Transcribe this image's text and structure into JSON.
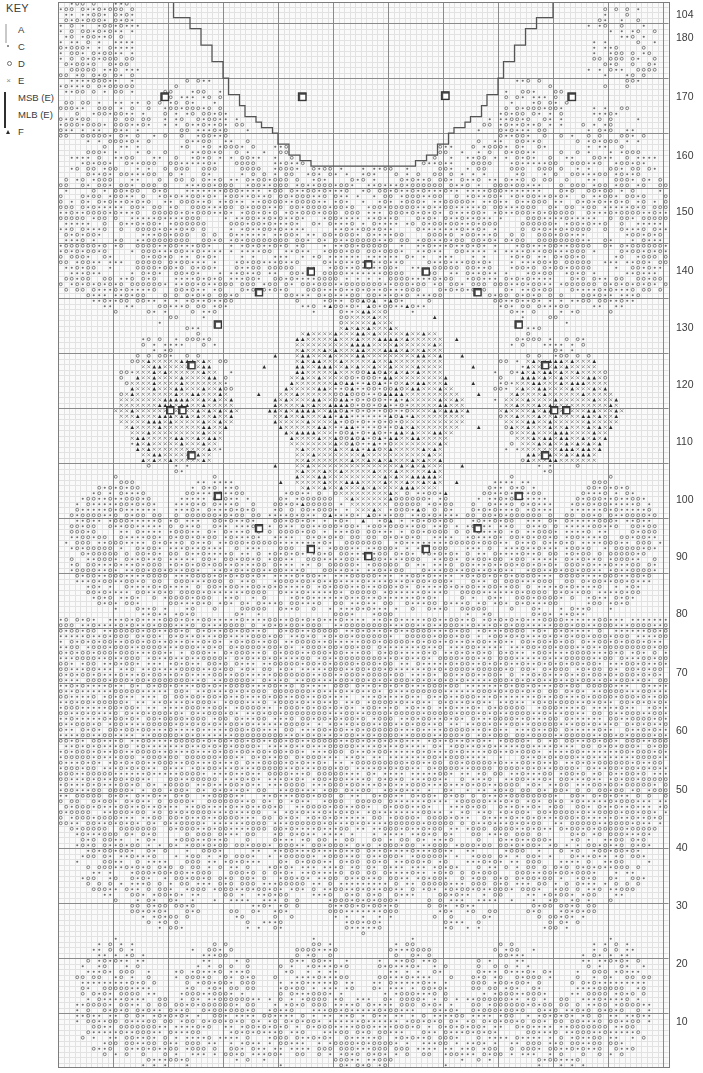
{
  "key": {
    "title": "KEY",
    "entries": [
      {
        "symbol": "light-square",
        "label": "A"
      },
      {
        "symbol": "small-dot",
        "label": "C"
      },
      {
        "symbol": "open-dot",
        "label": "D"
      },
      {
        "symbol": "cross-x",
        "label": "E"
      },
      {
        "symbol": "bead-square-small",
        "label": "MSB (E)"
      },
      {
        "symbol": "bead-square-large",
        "label": "MLB (E)"
      },
      {
        "symbol": "triangle",
        "label": "F"
      }
    ]
  },
  "row_axis": {
    "labels": [
      "104",
      "180",
      "170",
      "160",
      "150",
      "140",
      "130",
      "120",
      "110",
      "100",
      "90",
      "80",
      "70",
      "60",
      "50",
      "40",
      "30",
      "20",
      "10"
    ],
    "y_positions": [
      14,
      37,
      96,
      155,
      211,
      270,
      327,
      384,
      441,
      499,
      556,
      613,
      672,
      730,
      789,
      847,
      905,
      963,
      1021
    ]
  },
  "chart_data": {
    "type": "heatmap",
    "xlabel": "",
    "ylabel": "Row number",
    "grid": true,
    "legend_position": "top-left",
    "columns": 111,
    "rows": 194,
    "cell_px": 5.5,
    "major_gridline_every": 10,
    "colors": {
      "background": "#ffffff",
      "cell_fill": "#fafafa",
      "minor_grid": "#e2e2e2",
      "major_grid": "#8a8a8a",
      "border": "#7d7d7d",
      "symbol_dot": "#6e6e6e",
      "symbol_cross": "#8f8f8f",
      "symbol_triangle": "#2b2b2b",
      "bead_fill": "#4a4a4a",
      "bead_center": "#ffffff",
      "outline": "#555555"
    },
    "symbols": [
      "A",
      "C",
      "D",
      "E",
      "MSB (E)",
      "MLB (E)",
      "F"
    ],
    "regions": [
      {
        "name": "neckline-shaping",
        "type": "stepped-outline",
        "rows": [
          162,
          194
        ],
        "description": "Stepped U neckline opening across centre top"
      },
      {
        "name": "central-rosette",
        "type": "motif",
        "center_col": 56,
        "center_row": 120,
        "radius": 19,
        "symbols": [
          "E",
          "F"
        ],
        "description": "Large central flower motif of crosses and triangles"
      },
      {
        "name": "bead-ring",
        "type": "marker-ring",
        "center_col": 56,
        "center_row": 120,
        "radius": 26,
        "symbol": "MSB (E)",
        "count": 20
      },
      {
        "name": "left-side-motif",
        "type": "motif",
        "center_col": 21,
        "center_row": 120,
        "radius": 11,
        "symbols": [
          "E",
          "F"
        ]
      },
      {
        "name": "right-side-motif",
        "type": "motif",
        "center_col": 91,
        "center_row": 120,
        "radius": 11,
        "symbols": [
          "E",
          "F"
        ]
      },
      {
        "name": "upper-bead-markers",
        "type": "markers",
        "rows": [
          176,
          177
        ],
        "symbol": "MLB (E)",
        "count": 4
      },
      {
        "name": "lace-band-upper",
        "type": "texture",
        "rows": [
          130,
          160
        ],
        "symbols": [
          "C",
          "D"
        ]
      },
      {
        "name": "dense-body-band",
        "type": "texture",
        "rows": [
          55,
          82
        ],
        "symbols": [
          "C",
          "D"
        ],
        "description": "Solid densely worked band across full width"
      },
      {
        "name": "scallop-band-lower",
        "type": "texture",
        "rows": [
          30,
          52
        ],
        "symbols": [
          "C",
          "D"
        ]
      },
      {
        "name": "hem-motifs",
        "type": "texture",
        "rows": [
          1,
          28
        ],
        "symbols": [
          "C",
          "D"
        ]
      }
    ]
  }
}
